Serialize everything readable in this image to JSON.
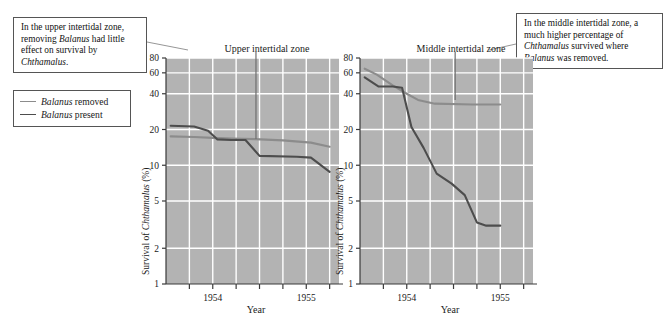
{
  "figure": {
    "legend": {
      "items": [
        {
          "label_prefix": "Balanus",
          "label_suffix": " removed",
          "color": "#8c8c8c",
          "name": "balanus-removed"
        },
        {
          "label_prefix": "Balanus",
          "label_suffix": " present",
          "color": "#4d4d4d",
          "name": "balanus-present"
        }
      ]
    },
    "callouts": [
      {
        "id": "upper",
        "text_runs": [
          {
            "t": "In the upper intertidal zone, removing ",
            "italic": false
          },
          {
            "t": "Balanus",
            "italic": true
          },
          {
            "t": " had little effect on survival by ",
            "italic": false
          },
          {
            "t": "Chthamalus",
            "italic": true
          },
          {
            "t": ".",
            "italic": false
          }
        ],
        "plain": "In the upper intertidal zone, removing Balanus had little effect on survival by Chthamalus."
      },
      {
        "id": "middle",
        "text_runs": [
          {
            "t": "In the middle intertidal zone, a much higher percentage of ",
            "italic": false
          },
          {
            "t": "Chthamalus",
            "italic": true
          },
          {
            "t": " survived where ",
            "italic": false
          },
          {
            "t": "Balanus",
            "italic": true
          },
          {
            "t": " was removed.",
            "italic": false
          }
        ],
        "plain": "In the middle intertidal zone, a much higher percentage of Chthamalus survived where Balanus was removed."
      }
    ],
    "colors": {
      "plot_background": "#b3b3b3",
      "gridline": "#ffffff",
      "axis": "#3a3a3a",
      "removed_line": "#8c8c8c",
      "present_line": "#4d4d4d",
      "callout_border": "#555555",
      "leader_line": "#777777"
    }
  },
  "chart_data": [
    {
      "type": "line",
      "id": "upper-intertidal",
      "title": "Upper intertidal zone",
      "xlabel": "Year",
      "ylabel": "Survival of Chthamalus (%)",
      "ylabel_italic_part": "Chthamalus",
      "yscale": "log",
      "ylim": [
        1,
        80
      ],
      "yticks": [
        80,
        60,
        40,
        20,
        10,
        5,
        2,
        1
      ],
      "ytick_labels": [
        "80",
        "60",
        "40",
        "20",
        "10",
        "5",
        "2",
        "1"
      ],
      "xlim": [
        1953.5,
        1955.35
      ],
      "xticks": [
        1953.75,
        1954.0,
        1954.25,
        1954.5,
        1954.75,
        1955.0,
        1955.25
      ],
      "xtick_labels": [
        "",
        "1954",
        "",
        "",
        "",
        "1955",
        ""
      ],
      "labeled_xticks": [
        {
          "x": 1954.0,
          "label": "1954"
        },
        {
          "x": 1955.0,
          "label": "1955"
        }
      ],
      "grid": true,
      "series": [
        {
          "name": "Balanus removed",
          "color": "#8c8c8c",
          "x": [
            1953.55,
            1953.8,
            1954.0,
            1954.2,
            1954.45,
            1954.75,
            1955.05,
            1955.25
          ],
          "y": [
            17.5,
            17.3,
            17.0,
            16.8,
            16.6,
            16.2,
            15.5,
            14.3
          ]
        },
        {
          "name": "Balanus present",
          "color": "#4d4d4d",
          "x": [
            1953.55,
            1953.8,
            1953.95,
            1954.05,
            1954.2,
            1954.35,
            1954.5,
            1954.9,
            1955.05,
            1955.25
          ],
          "y": [
            21.5,
            21.2,
            19.5,
            16.5,
            16.3,
            16.3,
            12.0,
            11.8,
            11.6,
            8.8
          ]
        }
      ]
    },
    {
      "type": "line",
      "id": "middle-intertidal",
      "title": "Middle intertidal zone",
      "xlabel": "Year",
      "ylabel": "Survival of Chthamalus (%)",
      "ylabel_italic_part": "Chthamalus",
      "yscale": "log",
      "ylim": [
        1,
        80
      ],
      "yticks": [
        80,
        60,
        40,
        20,
        10,
        5,
        2,
        1
      ],
      "ytick_labels": [
        "80",
        "60",
        "40",
        "20",
        "10",
        "5",
        "2",
        "1"
      ],
      "xlim": [
        1953.5,
        1955.35
      ],
      "xticks": [
        1953.75,
        1954.0,
        1954.25,
        1954.5,
        1954.75,
        1955.0,
        1955.25
      ],
      "xtick_labels": [
        "",
        "1954",
        "",
        "",
        "",
        "1955",
        ""
      ],
      "labeled_xticks": [
        {
          "x": 1954.0,
          "label": "1954"
        },
        {
          "x": 1955.0,
          "label": "1955"
        }
      ],
      "grid": true,
      "series": [
        {
          "name": "Balanus removed",
          "color": "#8c8c8c",
          "x": [
            1953.55,
            1953.68,
            1953.85,
            1954.0,
            1954.12,
            1954.3,
            1954.7,
            1955.0
          ],
          "y": [
            65.0,
            58.0,
            47.0,
            40.0,
            35.5,
            33.0,
            32.5,
            32.5
          ]
        },
        {
          "name": "Balanus present",
          "color": "#4d4d4d",
          "x": [
            1953.55,
            1953.7,
            1953.85,
            1953.95,
            1954.05,
            1954.18,
            1954.32,
            1954.48,
            1954.62,
            1954.75,
            1954.85,
            1955.0
          ],
          "y": [
            55.0,
            46.0,
            46.0,
            45.0,
            21.0,
            14.0,
            8.5,
            7.0,
            5.6,
            3.3,
            3.1,
            3.1
          ]
        }
      ]
    }
  ]
}
